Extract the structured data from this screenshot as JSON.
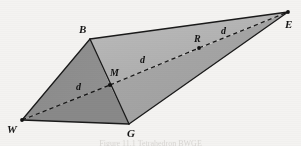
{
  "figure": {
    "kind": "tetrahedron-diagram",
    "background_color": "#f4f3f1",
    "stroke_color": "#1a1a1a",
    "caption_text": "Figure 11.1 Tetrahedron BWGE",
    "vertices": [
      {
        "id": "B",
        "label": "B",
        "x": 90,
        "y": 39,
        "label_x": 79,
        "label_y": 24,
        "dot": false
      },
      {
        "id": "E",
        "label": "E",
        "x": 288,
        "y": 12,
        "label_x": 285,
        "label_y": 19,
        "dot": true
      },
      {
        "id": "W",
        "label": "W",
        "x": 22,
        "y": 120,
        "label_x": 9,
        "label_y": 124,
        "dot": true
      },
      {
        "id": "G",
        "label": "G",
        "x": 129,
        "y": 124,
        "label_x": 128,
        "label_y": 128,
        "dot": false
      },
      {
        "id": "M",
        "label": "M",
        "x": 110,
        "y": 85,
        "label_x": 110,
        "label_y": 68,
        "dot": true
      },
      {
        "id": "R",
        "label": "R",
        "x": 199,
        "y": 48,
        "label_x": 194,
        "label_y": 34,
        "dot": true
      }
    ],
    "faces": [
      {
        "name": "face-b-e-m",
        "points": "90,39 288,12 199,48 110,85",
        "fill": "#b5b5b5"
      },
      {
        "name": "face-m-g-e",
        "points": "110,85 129,124 288,12",
        "fill": "#a8a8a8"
      },
      {
        "name": "face-w-b-m",
        "points": "22,120 90,39 110,85",
        "fill": "#8d8d8d"
      },
      {
        "name": "face-w-m-g",
        "points": "22,120 110,85 129,124",
        "fill": "#8a8a8a"
      }
    ],
    "solid_edges": [
      {
        "name": "edge-b-e",
        "x1": 90,
        "y1": 39,
        "x2": 288,
        "y2": 12
      },
      {
        "name": "edge-g-e",
        "x1": 129,
        "y1": 124,
        "x2": 288,
        "y2": 12
      },
      {
        "name": "edge-w-b",
        "x1": 22,
        "y1": 120,
        "x2": 90,
        "y2": 39
      },
      {
        "name": "edge-w-g",
        "x1": 22,
        "y1": 120,
        "x2": 129,
        "y2": 124
      },
      {
        "name": "edge-b-g",
        "x1": 90,
        "y1": 39,
        "x2": 129,
        "y2": 124
      }
    ],
    "dashed_edges": [
      {
        "name": "dashed-w-m",
        "x1": 22,
        "y1": 120,
        "x2": 110,
        "y2": 85
      },
      {
        "name": "dashed-m-r",
        "x1": 110,
        "y1": 85,
        "x2": 199,
        "y2": 48
      },
      {
        "name": "dashed-r-e",
        "x1": 199,
        "y1": 48,
        "x2": 288,
        "y2": 12
      }
    ],
    "measure_labels": [
      {
        "id": "d-wm",
        "label": "d",
        "x": 76,
        "y": 82
      },
      {
        "id": "d-mr",
        "label": "d",
        "x": 140,
        "y": 55
      },
      {
        "id": "d-re",
        "label": "d",
        "x": 221,
        "y": 26
      }
    ]
  }
}
